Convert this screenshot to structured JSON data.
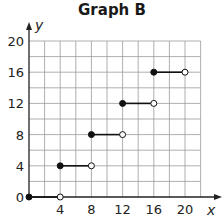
{
  "chart_data": {
    "type": "line",
    "subtype": "step",
    "title": "Graph B",
    "xlabel": "x",
    "ylabel": "y",
    "xlim": [
      0,
      22
    ],
    "ylim": [
      0,
      20
    ],
    "x_ticks": [
      4,
      8,
      12,
      16,
      20
    ],
    "y_ticks": [
      0,
      4,
      8,
      12,
      16,
      20
    ],
    "grid": true,
    "grid_step": 2,
    "segments": [
      {
        "x_start": 0,
        "x_end": 4,
        "y": 0,
        "start_closed": true,
        "end_closed": false
      },
      {
        "x_start": 4,
        "x_end": 8,
        "y": 4,
        "start_closed": true,
        "end_closed": false
      },
      {
        "x_start": 8,
        "x_end": 12,
        "y": 8,
        "start_closed": true,
        "end_closed": false
      },
      {
        "x_start": 12,
        "x_end": 16,
        "y": 12,
        "start_closed": true,
        "end_closed": false
      },
      {
        "x_start": 16,
        "x_end": 20,
        "y": 16,
        "start_closed": true,
        "end_closed": false
      }
    ]
  }
}
